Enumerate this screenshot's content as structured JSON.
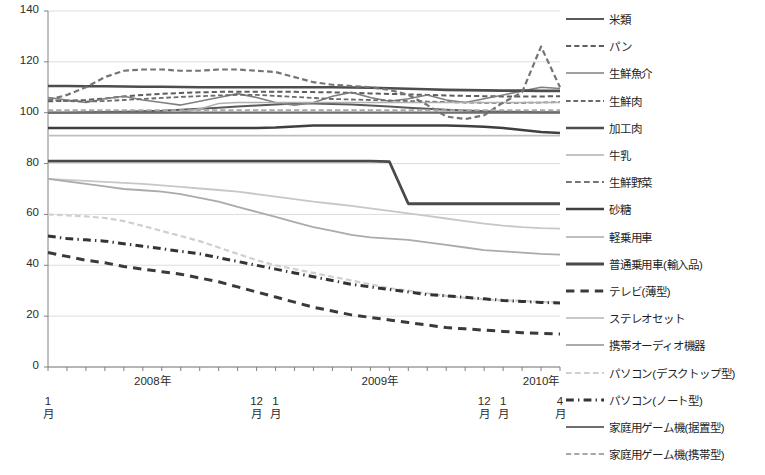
{
  "chart_data": {
    "type": "line",
    "title": "",
    "subtitle": "",
    "xlabel": "",
    "ylabel": "",
    "ylim": [
      0,
      140
    ],
    "ytick_step": 20,
    "yticks": [
      "0",
      "20",
      "40",
      "60",
      "80",
      "100",
      "120",
      "140"
    ],
    "grid": true,
    "grid_axis": "y",
    "legend_position": "right",
    "x_axis_note": "Monthly index, January 2008 through April 2010 (28 points)",
    "x_year_labels": [
      {
        "text": "2008年",
        "index": 5.5
      },
      {
        "text": "2009年",
        "index": 17.5
      },
      {
        "text": "2010年",
        "index": 26.0
      }
    ],
    "x_month_labels": [
      {
        "line1": "1",
        "line2": "月",
        "index": 0
      },
      {
        "line1": "12",
        "line2": "月",
        "index": 11
      },
      {
        "line1": "1",
        "line2": "月",
        "index": 12
      },
      {
        "line1": "12",
        "line2": "月",
        "index": 23
      },
      {
        "line1": "1",
        "line2": "月",
        "index": 24
      },
      {
        "line1": "4",
        "line2": "月",
        "index": 27
      }
    ],
    "x": [
      "2008-01",
      "2008-02",
      "2008-03",
      "2008-04",
      "2008-05",
      "2008-06",
      "2008-07",
      "2008-08",
      "2008-09",
      "2008-10",
      "2008-11",
      "2008-12",
      "2009-01",
      "2009-02",
      "2009-03",
      "2009-04",
      "2009-05",
      "2009-06",
      "2009-07",
      "2009-08",
      "2009-09",
      "2009-10",
      "2009-11",
      "2009-12",
      "2010-01",
      "2010-02",
      "2010-03",
      "2010-04"
    ],
    "series": [
      {
        "name": "米類",
        "style": "solid",
        "color": "#595959",
        "width": 2.0,
        "values": [
          100.0,
          100.0,
          100.2,
          100.3,
          100.4,
          100.6,
          100.8,
          101.2,
          101.6,
          102.0,
          102.4,
          102.8,
          103.2,
          103.6,
          103.6,
          103.4,
          103.2,
          102.8,
          102.4,
          102.0,
          101.6,
          101.2,
          100.9,
          100.6,
          100.4,
          100.3,
          100.2,
          100.2
        ]
      },
      {
        "name": "パン",
        "style": "dashed",
        "color": "#5e5e5e",
        "width": 2.0,
        "values": [
          104.5,
          104.7,
          105.0,
          105.6,
          106.4,
          107.0,
          107.4,
          107.8,
          108.0,
          108.2,
          108.2,
          108.2,
          108.2,
          108.2,
          108.1,
          108.0,
          107.8,
          107.6,
          107.4,
          107.2,
          107.0,
          106.8,
          106.6,
          106.5,
          106.4,
          106.4,
          106.4,
          106.5
        ]
      },
      {
        "name": "生鮮魚介",
        "style": "solid",
        "color": "#7f7f7f",
        "width": 1.6,
        "values": [
          106.0,
          105.0,
          104.0,
          105.5,
          106.5,
          105.0,
          104.0,
          103.0,
          104.5,
          106.0,
          107.5,
          106.0,
          104.0,
          103.0,
          104.0,
          106.5,
          108.0,
          106.0,
          104.5,
          105.5,
          107.0,
          105.0,
          104.0,
          105.5,
          107.0,
          108.5,
          110.0,
          109.5
        ]
      },
      {
        "name": "生鮮肉",
        "style": "dashed",
        "color": "#6b6b6b",
        "width": 1.8,
        "values": [
          105.0,
          104.6,
          104.4,
          104.6,
          105.0,
          105.4,
          105.8,
          106.2,
          106.5,
          106.8,
          107.0,
          107.0,
          106.6,
          106.2,
          105.8,
          105.4,
          105.2,
          105.0,
          104.8,
          104.6,
          104.4,
          104.2,
          104.0,
          103.9,
          103.8,
          103.9,
          104.0,
          104.2
        ]
      },
      {
        "name": "加工肉",
        "style": "solid",
        "color": "#4d4d4d",
        "width": 2.6,
        "values": [
          110.5,
          110.5,
          110.4,
          110.4,
          110.3,
          110.2,
          110.2,
          110.1,
          110.0,
          110.0,
          110.0,
          110.0,
          110.0,
          110.0,
          110.0,
          110.0,
          109.9,
          109.8,
          109.6,
          109.4,
          109.2,
          109.0,
          108.9,
          108.8,
          108.7,
          108.7,
          108.6,
          108.6
        ]
      },
      {
        "name": "牛乳",
        "style": "solid",
        "color": "#b0b0b0",
        "width": 1.6,
        "values": [
          100.0,
          100.0,
          100.0,
          100.0,
          100.0,
          100.0,
          100.0,
          100.2,
          101.5,
          103.6,
          104.0,
          104.0,
          104.0,
          104.0,
          104.0,
          104.0,
          104.0,
          104.0,
          104.0,
          104.0,
          104.0,
          104.0,
          104.0,
          104.0,
          104.0,
          104.0,
          104.0,
          104.0
        ]
      },
      {
        "name": "生鮮野菜",
        "style": "dashed",
        "color": "#747474",
        "width": 2.2,
        "values": [
          105.0,
          107.0,
          110.0,
          114.0,
          116.5,
          117.0,
          117.0,
          116.5,
          116.5,
          117.0,
          117.0,
          116.5,
          116.0,
          114.0,
          112.0,
          111.0,
          110.5,
          110.0,
          109.0,
          107.0,
          103.0,
          98.5,
          97.5,
          99.0,
          104.0,
          108.0,
          126.0,
          110.0
        ]
      },
      {
        "name": "砂糖",
        "style": "solid",
        "color": "#3f3f3f",
        "width": 2.6,
        "values": [
          94.0,
          94.0,
          94.0,
          94.0,
          94.0,
          94.0,
          94.0,
          94.0,
          94.0,
          94.0,
          94.0,
          94.0,
          94.2,
          94.6,
          95.0,
          95.0,
          95.0,
          95.0,
          95.0,
          95.0,
          95.0,
          95.0,
          94.8,
          94.5,
          94.0,
          93.2,
          92.4,
          92.0
        ]
      },
      {
        "name": "軽乗用車",
        "style": "solid",
        "color": "#bfbfbf",
        "width": 1.8,
        "values": [
          91.0,
          91.0,
          91.0,
          91.0,
          91.0,
          91.0,
          91.0,
          91.0,
          91.0,
          91.0,
          91.0,
          91.0,
          91.0,
          91.0,
          91.0,
          91.0,
          91.0,
          91.0,
          91.0,
          91.0,
          91.0,
          91.0,
          91.0,
          91.0,
          91.0,
          91.0,
          91.0,
          91.0
        ]
      },
      {
        "name": "普通乗用車(輸入品)",
        "style": "solid",
        "color": "#4a4a4a",
        "width": 2.8,
        "values": [
          81.0,
          81.0,
          81.0,
          81.0,
          81.0,
          81.0,
          81.0,
          81.0,
          81.0,
          81.0,
          81.0,
          81.0,
          81.0,
          81.0,
          81.0,
          81.0,
          81.0,
          81.0,
          80.8,
          64.2,
          64.2,
          64.2,
          64.2,
          64.2,
          64.2,
          64.2,
          64.2,
          64.2
        ]
      },
      {
        "name": "テレビ(薄型)",
        "style": "dashed-long",
        "color": "#3a3a3a",
        "width": 3.0,
        "values": [
          45.0,
          43.5,
          42.0,
          41.0,
          39.5,
          38.5,
          37.5,
          36.5,
          35.0,
          33.5,
          31.5,
          29.5,
          27.5,
          25.5,
          23.5,
          22.0,
          20.5,
          19.5,
          18.5,
          17.5,
          16.5,
          15.5,
          15.0,
          14.5,
          14.0,
          13.5,
          13.2,
          13.0
        ]
      },
      {
        "name": "ステレオセット",
        "style": "solid",
        "color": "#c7c7c7",
        "width": 1.8,
        "values": [
          74.0,
          73.6,
          73.2,
          72.8,
          72.4,
          72.0,
          71.4,
          70.8,
          70.2,
          69.6,
          69.0,
          68.0,
          67.0,
          66.0,
          65.0,
          64.2,
          63.4,
          62.4,
          61.4,
          60.4,
          59.4,
          58.4,
          57.4,
          56.4,
          55.6,
          55.0,
          54.6,
          54.4
        ]
      },
      {
        "name": "携帯オーディオ機器",
        "style": "solid",
        "color": "#ababab",
        "width": 1.8,
        "values": [
          74.0,
          73.0,
          72.0,
          71.0,
          70.0,
          69.5,
          69.0,
          68.0,
          66.5,
          65.0,
          63.0,
          61.0,
          59.0,
          57.0,
          55.0,
          53.5,
          52.0,
          51.0,
          50.5,
          50.0,
          49.0,
          48.0,
          47.0,
          46.0,
          45.5,
          45.0,
          44.5,
          44.2
        ]
      },
      {
        "name": "パソコン(デスクトップ型)",
        "style": "dashed",
        "color": "#cfcfcf",
        "width": 2.2,
        "values": [
          60.0,
          59.6,
          59.2,
          58.6,
          57.4,
          55.5,
          53.5,
          51.5,
          49.5,
          47.0,
          44.5,
          42.0,
          40.0,
          38.5,
          37.0,
          35.5,
          34.0,
          32.5,
          31.0,
          30.0,
          29.0,
          28.0,
          27.2,
          26.6,
          26.2,
          26.0,
          25.6,
          25.4
        ]
      },
      {
        "name": "パソコン(ノート型)",
        "style": "dash-dot",
        "color": "#333333",
        "width": 3.0,
        "values": [
          51.5,
          50.5,
          50.0,
          49.5,
          48.5,
          47.5,
          46.5,
          45.5,
          44.5,
          43.0,
          41.5,
          40.0,
          38.5,
          37.0,
          35.5,
          34.0,
          32.5,
          31.5,
          30.5,
          29.5,
          28.5,
          28.0,
          27.4,
          26.8,
          26.2,
          25.8,
          25.4,
          25.2
        ]
      },
      {
        "name": "家庭用ゲーム機(据置型)",
        "style": "solid",
        "color": "#6e6e6e",
        "width": 2.2,
        "values": [
          100.0,
          100.0,
          100.0,
          100.0,
          100.0,
          100.0,
          100.0,
          100.0,
          100.0,
          100.0,
          100.0,
          100.0,
          100.0,
          100.0,
          100.0,
          100.0,
          100.0,
          100.0,
          100.0,
          100.0,
          100.0,
          100.0,
          100.0,
          100.0,
          100.0,
          100.0,
          100.0,
          100.0
        ]
      },
      {
        "name": "家庭用ゲーム機(携帯型)",
        "style": "dashed",
        "color": "#a8a8a8",
        "width": 2.0,
        "values": [
          101.0,
          101.0,
          101.0,
          101.0,
          101.0,
          101.0,
          101.0,
          101.0,
          101.0,
          101.0,
          101.0,
          101.0,
          101.0,
          101.0,
          101.0,
          101.0,
          101.0,
          101.0,
          101.0,
          101.0,
          101.0,
          101.0,
          101.0,
          101.0,
          101.0,
          101.0,
          101.0,
          101.0
        ]
      }
    ]
  },
  "legend": {
    "items": [
      {
        "label": "米類",
        "style": "solid",
        "color": "#595959",
        "width": 2.0
      },
      {
        "label": "パン",
        "style": "dashed",
        "color": "#5e5e5e",
        "width": 2.0
      },
      {
        "label": "生鮮魚介",
        "style": "solid",
        "color": "#7f7f7f",
        "width": 1.6
      },
      {
        "label": "生鮮肉",
        "style": "dashed",
        "color": "#6b6b6b",
        "width": 1.8
      },
      {
        "label": "加工肉",
        "style": "solid",
        "color": "#4d4d4d",
        "width": 2.6
      },
      {
        "label": "牛乳",
        "style": "solid",
        "color": "#b0b0b0",
        "width": 1.6
      },
      {
        "label": "生鮮野菜",
        "style": "dashed",
        "color": "#747474",
        "width": 2.2
      },
      {
        "label": "砂糖",
        "style": "solid",
        "color": "#3f3f3f",
        "width": 2.6
      },
      {
        "label": "軽乗用車",
        "style": "solid",
        "color": "#bfbfbf",
        "width": 1.8
      },
      {
        "label": "普通乗用車(輸入品)",
        "style": "solid",
        "color": "#4a4a4a",
        "width": 2.8
      },
      {
        "label": "テレビ(薄型)",
        "style": "dashed-long",
        "color": "#3a3a3a",
        "width": 3.0
      },
      {
        "label": "ステレオセット",
        "style": "solid",
        "color": "#c7c7c7",
        "width": 1.8
      },
      {
        "label": "携帯オーディオ機器",
        "style": "solid",
        "color": "#ababab",
        "width": 1.8
      },
      {
        "label": "パソコン(デスクトップ型)",
        "style": "dashed",
        "color": "#cfcfcf",
        "width": 2.2
      },
      {
        "label": "パソコン(ノート型)",
        "style": "dash-dot",
        "color": "#333333",
        "width": 3.0
      },
      {
        "label": "家庭用ゲーム機(据置型)",
        "style": "solid",
        "color": "#6e6e6e",
        "width": 2.2
      },
      {
        "label": "家庭用ゲーム機(携帯型)",
        "style": "dashed",
        "color": "#a8a8a8",
        "width": 2.0
      }
    ]
  },
  "colors": {
    "axis": "#808080",
    "grid": "#d9d9d9",
    "text": "#262626",
    "background": "#ffffff"
  }
}
